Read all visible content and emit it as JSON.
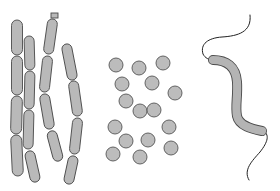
{
  "figure": {
    "width": 280,
    "height": 191,
    "background": "#ffffff",
    "colors": {
      "cell_fill": "#b9b9b9",
      "cell_outline": "#4a4a4a",
      "flagellum": "#222222"
    },
    "groups": [
      {
        "name": "bacilli",
        "chains": [
          {
            "width": 11,
            "segments": [
              [
                17,
                20,
                17,
                55
              ],
              [
                17,
                56,
                17,
                95
              ],
              [
                17,
                96,
                16,
                134
              ],
              [
                16,
                135,
                18,
                176
              ]
            ]
          },
          {
            "width": 10,
            "segments": [
              [
                29,
                36,
                30,
                70
              ],
              [
                30,
                71,
                29,
                109
              ],
              [
                29,
                110,
                28,
                149
              ],
              [
                29,
                151,
                36,
                182
              ]
            ]
          },
          {
            "width": 10,
            "segments": [
              [
                53,
                19,
                48,
                54
              ],
              [
                48,
                56,
                44,
                92
              ],
              [
                44,
                94,
                50,
                129
              ],
              [
                51,
                131,
                59,
                161
              ]
            ]
          },
          {
            "width": 10,
            "segments": [
              [
                66,
                44,
                73,
                80
              ],
              [
                73,
                81,
                78,
                116
              ],
              [
                78,
                118,
                74,
                154
              ],
              [
                74,
                156,
                68,
                184
              ]
            ]
          }
        ],
        "stub": [
          51,
          13,
          58,
          18
        ]
      },
      {
        "name": "cocci",
        "radius": 7,
        "centers": [
          [
            116,
            65
          ],
          [
            139,
            68
          ],
          [
            163,
            63
          ],
          [
            122,
            84
          ],
          [
            152,
            83
          ],
          [
            175,
            93
          ],
          [
            126,
            101
          ],
          [
            140,
            111
          ],
          [
            154,
            110
          ],
          [
            115,
            127
          ],
          [
            169,
            127
          ],
          [
            126,
            141
          ],
          [
            148,
            140
          ],
          [
            113,
            154
          ],
          [
            171,
            148
          ],
          [
            140,
            157
          ]
        ]
      },
      {
        "name": "spirillum",
        "body_path": "M213,60 C226,60 236,66 237,82 C238,96 235,106 237,116 C239,126 252,129 262,131",
        "flagella": [
          "M250,15 C252,32 238,36 222,37 C208,38 200,44 203,54 C205,58 209,60 213,60",
          "M263,131 C270,134 268,142 260,152 C252,161 243,170 249,180"
        ]
      }
    ]
  }
}
